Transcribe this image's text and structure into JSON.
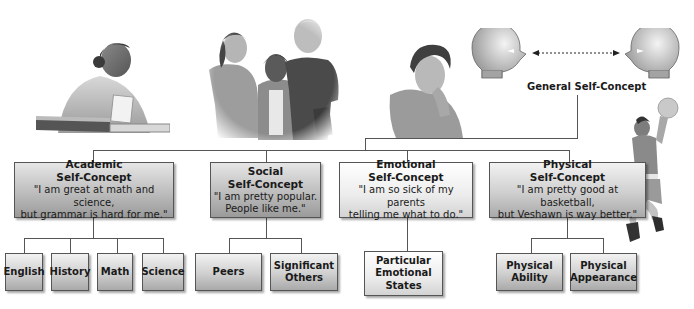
{
  "general": {
    "label": "General Self-Concept"
  },
  "categories": [
    {
      "title_line1": "Academic",
      "title_line2": "Self-Concept",
      "quote_line1": "\"I am great at math and science,",
      "quote_line2": "but grammar is hard for me.\"",
      "children": [
        "English",
        "History",
        "Math",
        "Science"
      ]
    },
    {
      "title_line1": "Social",
      "title_line2": "Self-Concept",
      "quote_line1": "\"I am pretty popular.",
      "quote_line2": "People like me.\"",
      "children": [
        [
          "Peers"
        ],
        [
          "Significant",
          "Others"
        ]
      ]
    },
    {
      "title_line1": "Emotional",
      "title_line2": "Self-Concept",
      "quote_line1": "\"I am so sick of my parents",
      "quote_line2": "telling me what to do.\"",
      "children": [
        [
          "Particular",
          "Emotional",
          "States"
        ]
      ]
    },
    {
      "title_line1": "Physical",
      "title_line2": "Self-Concept",
      "quote_line1": "\"I am pretty good at basketball,",
      "quote_line2": "but Veshawn is way better.\"",
      "children": [
        [
          "Physical",
          "Ability"
        ],
        [
          "Physical",
          "Appearance"
        ]
      ]
    }
  ],
  "illustrations": {
    "academic": "student-studying-illustration",
    "social": "group-of-friends-illustration",
    "emotional": "frustrated-teen-illustration",
    "physical": "basketball-player-illustration",
    "general": "two-heads-facing-illustration"
  }
}
